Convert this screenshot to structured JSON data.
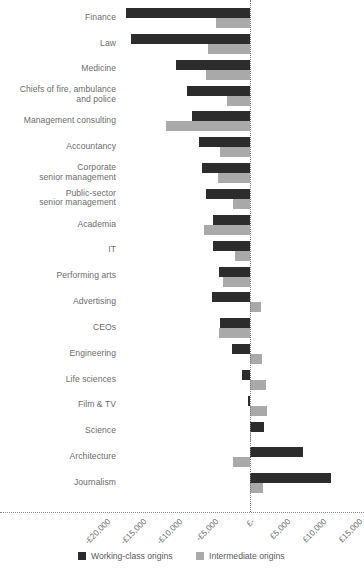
{
  "chart_data": {
    "type": "bar",
    "orientation": "horizontal",
    "title": "",
    "subtitle": "",
    "xlabel": "",
    "ylabel": "",
    "xlim": [
      -22000,
      16000
    ],
    "grid": false,
    "zero_line": true,
    "legend_position": "bottom-left",
    "xticks": [
      -20000,
      -15000,
      -10000,
      -5000,
      0,
      5000,
      10000,
      15000
    ],
    "xticklabels": [
      "-£20,000",
      "-£15,000",
      "-£10,000",
      "-£5,000",
      "£-",
      "£5,000",
      "£10,000",
      "£15,000"
    ],
    "categories": [
      "Finance",
      "Law",
      "Medicine",
      "Chiefs of fire, ambulance\nand police",
      "Management consulting",
      "Accountancy",
      "Corporate\nsenior management",
      "Public-sector\nsenior management",
      "Academia",
      "IT",
      "Performing arts",
      "Advertising",
      "CEOs",
      "Engineering",
      "Life sciences",
      "Film & TV",
      "Science",
      "Architecture",
      "Journalism"
    ],
    "series": [
      {
        "name": "Working-class origins",
        "color": "#2c2c2c",
        "values": [
          -17200,
          -16500,
          -10300,
          -8750,
          -8050,
          -7100,
          -6700,
          -6100,
          -5100,
          -5100,
          -4300,
          -5300,
          -4200,
          -2500,
          -1100,
          -300,
          2000,
          7400,
          11300
        ]
      },
      {
        "name": "Intermediate origins",
        "color": "#a9a9a9",
        "values": [
          -4700,
          -5800,
          -6100,
          -3200,
          -11700,
          -4200,
          -4400,
          -2400,
          -6400,
          -2100,
          -3750,
          1500,
          -4300,
          1700,
          2200,
          2400,
          100,
          -2400,
          1800
        ]
      }
    ]
  },
  "legend": {
    "items": [
      {
        "label": "Working-class origins",
        "color": "#2c2c2c"
      },
      {
        "label": "Intermediate origins",
        "color": "#a9a9a9"
      }
    ]
  }
}
